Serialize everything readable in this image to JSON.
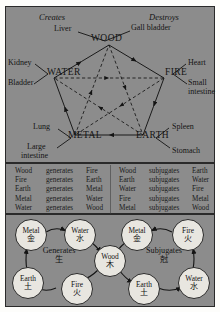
{
  "figure": {
    "panels": [
      "wu-xing-pentagram",
      "relations-tables",
      "generating-subjugating-cycles"
    ],
    "bg_color": "#8c8c8c",
    "ink_color": "#141414",
    "node_fill": "#e8e6e0"
  },
  "top": {
    "caption_left": "Creates",
    "caption_right": "Destroys",
    "elements": [
      {
        "key": "wood",
        "label": "WOOD",
        "organs": [
          "Liver",
          "Gall bladder"
        ]
      },
      {
        "key": "water",
        "label": "WATER",
        "organs": [
          "Kidney",
          "Bladder"
        ]
      },
      {
        "key": "fire",
        "label": "FIRE",
        "organs": [
          "Heart",
          "Small intestine"
        ]
      },
      {
        "key": "metal",
        "label": "METAL",
        "organs": [
          "Lung",
          "Large intestine"
        ]
      },
      {
        "key": "earth",
        "label": "EARTH",
        "organs": [
          "Spleen",
          "Stomach"
        ]
      }
    ],
    "organ_labels": {
      "liver": "Liver",
      "gall_bladder": "Gall bladder",
      "kidney": "Kidney",
      "bladder": "Bladder",
      "heart": "Heart",
      "small_intestine_1": "Small",
      "small_intestine_2": "intestine",
      "lung": "Lung",
      "large_intestine_1": "Large",
      "large_intestine_2": "intestine",
      "spleen": "Spleen",
      "stomach": "Stomach"
    },
    "cycle_solid": [
      "WOOD",
      "FIRE",
      "EARTH",
      "METAL",
      "WATER"
    ],
    "cycle_dashed": [
      "WOOD",
      "EARTH",
      "WATER",
      "FIRE",
      "METAL"
    ]
  },
  "tables": {
    "generates": {
      "verb": "generates",
      "rows": [
        {
          "subject": "Wood",
          "verb": "generates",
          "object": "Fire"
        },
        {
          "subject": "Fire",
          "verb": "generates",
          "object": "Earth"
        },
        {
          "subject": "Earth",
          "verb": "generates",
          "object": "Metal"
        },
        {
          "subject": "Metal",
          "verb": "generates",
          "object": "Water"
        },
        {
          "subject": "Water",
          "verb": "generates",
          "object": "Wood"
        }
      ]
    },
    "subjugates": {
      "verb": "subjugates",
      "rows": [
        {
          "subject": "Wood",
          "verb": "subjugates",
          "object": "Earth"
        },
        {
          "subject": "Earth",
          "verb": "subjugates",
          "object": "Water"
        },
        {
          "subject": "Water",
          "verb": "subjugates",
          "object": "Fire"
        },
        {
          "subject": "Fire",
          "verb": "subjugates",
          "object": "Metal"
        },
        {
          "subject": "Metal",
          "verb": "subjugates",
          "object": "Wood"
        }
      ]
    }
  },
  "bottom": {
    "left_cycle": {
      "title_en": "Generates",
      "title_cn": "生",
      "order": [
        "Metal",
        "Water",
        "Wood",
        "Fire",
        "Earth"
      ],
      "nodes": [
        {
          "en": "Metal",
          "cn": "金"
        },
        {
          "en": "Water",
          "cn": "水"
        },
        {
          "en": "Wood",
          "cn": "木"
        },
        {
          "en": "Fire",
          "cn": "火"
        },
        {
          "en": "Earth",
          "cn": "土"
        }
      ]
    },
    "right_cycle": {
      "title_en": "Subjugates",
      "title_cn": "尅",
      "order": [
        "Wood",
        "Earth",
        "Water",
        "Fire",
        "Metal"
      ],
      "nodes": [
        {
          "en": "Metal",
          "cn": "金"
        },
        {
          "en": "Fire",
          "cn": "火"
        },
        {
          "en": "Earth",
          "cn": "土"
        },
        {
          "en": "Water",
          "cn": "水"
        }
      ]
    },
    "shared_node": {
      "en": "Wood",
      "cn": "木"
    }
  }
}
